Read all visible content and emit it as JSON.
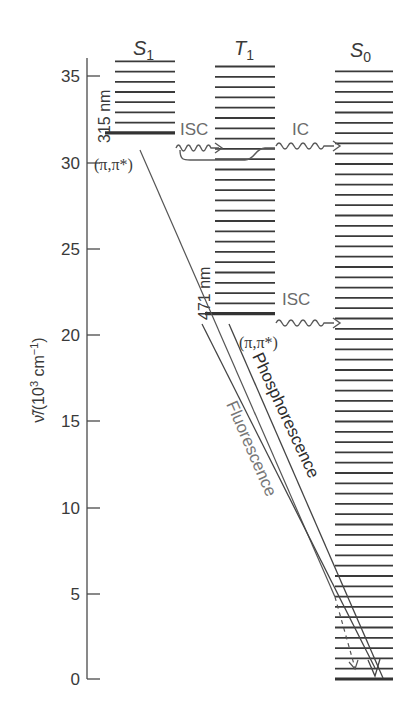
{
  "diagram": {
    "type": "jablonski",
    "axis": {
      "label": "ṽ/(10³ cm⁻¹)",
      "label_main": "ν̃/(10",
      "label_sup1": "3",
      "label_mid": " cm",
      "label_sup2": "−1",
      "label_end": ")",
      "ticks": [
        "0",
        "5",
        "10",
        "15",
        "20",
        "25",
        "30",
        "35"
      ],
      "min": 0,
      "max": 36
    },
    "states": [
      {
        "id": "S1",
        "name": "S",
        "sub": "1",
        "ground_level": 31.7,
        "top_level": 36,
        "wavelength_label": "315 nm",
        "character": "(π,π*)"
      },
      {
        "id": "T1",
        "name": "T",
        "sub": "1",
        "ground_level": 21.2,
        "top_level": 35.6,
        "wavelength_label": "471 nm",
        "character": "(π,π*)"
      },
      {
        "id": "S0",
        "name": "S",
        "sub": "0",
        "ground_level": 0,
        "top_level": 35.8
      }
    ],
    "transitions": [
      {
        "label": "ISC",
        "from": "S1",
        "to": "T1",
        "kind": "nonradiative-wavy"
      },
      {
        "label": "IC",
        "from": "T1",
        "to": "S0",
        "kind": "nonradiative-wavy"
      },
      {
        "label": "ISC",
        "from": "T1",
        "to": "S0",
        "kind": "nonradiative-wavy"
      },
      {
        "label": "Fluorescence",
        "from": "S1",
        "to": "S0",
        "kind": "radiative"
      },
      {
        "label": "Phosphorescence",
        "from": "T1",
        "to": "S0",
        "kind": "radiative"
      }
    ],
    "colors": {
      "ink": "#3a3a3a",
      "grey": "#6b6b6b",
      "background": "#ffffff"
    }
  }
}
